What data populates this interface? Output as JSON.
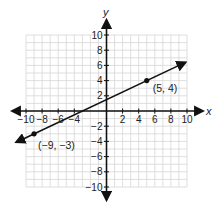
{
  "chart_data": {
    "type": "line",
    "title": "",
    "xlabel": "x",
    "ylabel": "y",
    "xlim": [
      -10,
      10
    ],
    "ylim": [
      -10,
      10
    ],
    "grid": true,
    "grid_step": 1,
    "x_ticks": [
      -10,
      -8,
      -6,
      -4,
      2,
      4,
      6,
      8,
      10
    ],
    "x_tick_labels": [
      "−10",
      "−8",
      "−6",
      "−4",
      "2",
      "4",
      "6",
      "8",
      "10"
    ],
    "y_ticks": [
      10,
      8,
      6,
      4,
      2,
      -2,
      -4,
      -6,
      -8,
      -10
    ],
    "y_tick_labels": [
      "10",
      "8",
      "6",
      "4",
      "2",
      "−2",
      "−4",
      "−6",
      "−8",
      "−10"
    ],
    "series": [
      {
        "name": "line",
        "type": "line",
        "arrows_both_ends": true,
        "points": [
          {
            "x": -9,
            "y": -3,
            "label": "(−9, −3)"
          },
          {
            "x": 5,
            "y": 4,
            "label": "(5, 4)"
          }
        ],
        "slope": 0.5,
        "intercept": 1.5
      }
    ],
    "legend": null
  },
  "labels": {
    "x_axis": "x",
    "y_axis": "y",
    "point_a": "(5, 4)",
    "point_b": "(−9, −3)"
  },
  "colors": {
    "grid": "#d6d6d6",
    "axis": "#111111",
    "line": "#111111"
  }
}
